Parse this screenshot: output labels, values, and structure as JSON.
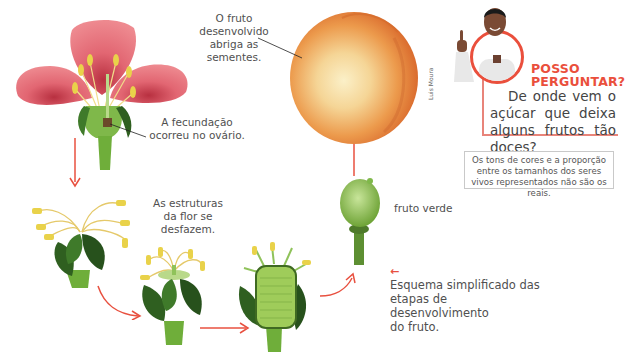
{
  "illustration": {
    "title": "Desenvolvimento do fruto",
    "credit": "Luis Moura",
    "stages": [
      {
        "id": "flower",
        "label": "A fecundação ocorreu no ovário."
      },
      {
        "id": "wilting",
        "label": "As estruturas da flor se desfazem."
      },
      {
        "id": "swelling",
        "label": ""
      },
      {
        "id": "green-fruit",
        "label": "fruto verde"
      },
      {
        "id": "ripe-fruit",
        "label": "O fruto desenvolvido abriga as sementes."
      }
    ],
    "labels": {
      "fecundacao_1": "A fecundação",
      "fecundacao_2": "ocorreu no ovário.",
      "estruturas_1": "As estruturas",
      "estruturas_2": "da flor se",
      "estruturas_3": "desfazem.",
      "fruto_verde": "fruto verde",
      "fruto_1": "O fruto",
      "fruto_2": "desenvolvido",
      "fruto_3": "abriga as",
      "fruto_4": "sementes."
    },
    "colors": {
      "arrow": "#e8503f",
      "petal": "#e0606a",
      "leaf": "#3f7a2a",
      "stem": "#6fae3a",
      "anther": "#e9d24a",
      "fruit_orange": "#e98a3a",
      "fruit_light": "#f7e3a8",
      "green_fruit": "#9fcc5a"
    }
  },
  "posso_perguntar": {
    "title_line1": "POSSO",
    "title_line2": "PERGUNTAR?",
    "question": "De onde vem o açúcar que deixa alguns frutos tão doces?",
    "accent_color": "#ea4f3c"
  },
  "note": {
    "text": "Os tons de cores e a proporção entre os tamanhos dos seres vivos representados não são os reais."
  },
  "schema_caption": {
    "arrow_icon": "←",
    "line1": "Esquema simplificado das",
    "line2": "etapas de desenvolvimento",
    "line3": "do fruto."
  }
}
